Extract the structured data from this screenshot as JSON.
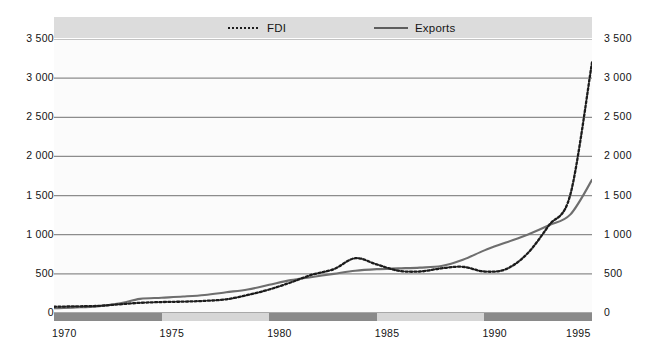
{
  "legend": {
    "items": [
      {
        "label": "FDI",
        "style": "dotted",
        "icon": "dotted-line-icon",
        "color": "#1c1c1c"
      },
      {
        "label": "Exports",
        "style": "solid",
        "icon": "solid-line-icon",
        "color": "#5d5d5d"
      }
    ]
  },
  "axes": {
    "y_left_ticks": [
      "0",
      "500",
      "1 000",
      "1 500",
      "2 000",
      "2 500",
      "3 000",
      "3 500"
    ],
    "y_right_ticks": [
      "0",
      "500",
      "1 000",
      "1 500",
      "2 000",
      "2 500",
      "3 000",
      "3 500"
    ],
    "x_ticks": [
      "1970",
      "1975",
      "1980",
      "1985",
      "1990",
      "1995"
    ]
  },
  "colors": {
    "background": "#ffffff",
    "plot_background": "#fbfbfb",
    "legend_strip": "#dcdcdc",
    "gridline": "#8c8c8c",
    "fdi_line": "#1c1c1c",
    "exports_line": "#6e6e6e",
    "band_dark": "#8a8a8a",
    "band_light": "#d6d6d6"
  },
  "chart_data": {
    "type": "line",
    "title": "",
    "subtitle": "",
    "xlabel": "",
    "ylabel": "",
    "xlim": [
      1970,
      1995
    ],
    "ylim": [
      0,
      3500
    ],
    "ytick_step": 500,
    "grid": true,
    "legend_position": "top",
    "x": [
      1970,
      1971,
      1972,
      1973,
      1974,
      1975,
      1976,
      1977,
      1978,
      1979,
      1980,
      1981,
      1982,
      1983,
      1984,
      1985,
      1986,
      1987,
      1988,
      1989,
      1990,
      1991,
      1992,
      1993,
      1994,
      1995
    ],
    "series": [
      {
        "name": "FDI",
        "style": "dotted",
        "color": "#1c1c1c",
        "values": [
          80,
          85,
          90,
          110,
          130,
          140,
          145,
          155,
          175,
          230,
          300,
          390,
          490,
          560,
          700,
          620,
          540,
          530,
          570,
          590,
          530,
          560,
          760,
          1120,
          1520,
          3200
        ]
      },
      {
        "name": "Exports",
        "style": "solid",
        "color": "#6e6e6e",
        "values": [
          60,
          70,
          85,
          120,
          180,
          195,
          210,
          230,
          265,
          300,
          360,
          420,
          460,
          500,
          540,
          560,
          570,
          580,
          600,
          680,
          800,
          900,
          1000,
          1120,
          1260,
          1700
        ]
      }
    ],
    "fdi_detail_note": "FDI peaks near 2 150 around 1990 and dips to about 1 650 in 1992",
    "x_axis_bands": [
      {
        "from": 1970,
        "to": 1975,
        "shade": "dark"
      },
      {
        "from": 1975,
        "to": 1980,
        "shade": "light"
      },
      {
        "from": 1980,
        "to": 1985,
        "shade": "dark"
      },
      {
        "from": 1985,
        "to": 1990,
        "shade": "light"
      },
      {
        "from": 1990,
        "to": 1995,
        "shade": "dark"
      }
    ]
  }
}
